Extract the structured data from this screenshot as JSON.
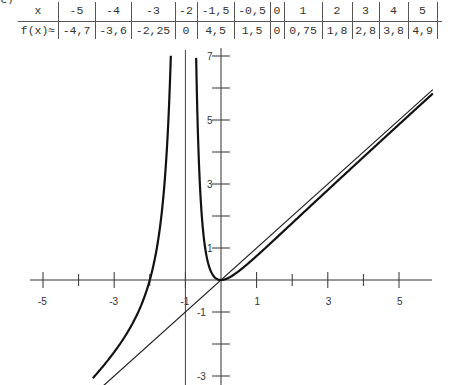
{
  "part_label": "c)",
  "table": {
    "row_headers": [
      "x",
      "f(x)≈"
    ],
    "x_values": [
      "-5",
      "-4",
      "-3",
      "-2",
      "-1,5",
      "-0,5",
      "0",
      "1",
      "2",
      "3",
      "4",
      "5"
    ],
    "f_values": [
      "-4,7",
      "-3,6",
      "-2,25",
      "0",
      "4,5",
      "1,5",
      "0",
      "0,75",
      "1,8",
      "2,8",
      "3,8",
      "4,9"
    ]
  },
  "axes": {
    "x_tick_labels": [
      "-5",
      "-3",
      "-1",
      "1",
      "3",
      "5"
    ],
    "y_tick_labels": [
      "7",
      "5",
      "3",
      "1",
      "-1",
      "-3"
    ]
  },
  "chart_data": {
    "type": "line",
    "title": "",
    "xlabel": "",
    "ylabel": "",
    "xlim": [
      -5.3,
      6
    ],
    "ylim": [
      -3.2,
      7.2
    ],
    "grid": false,
    "x_ticks": [
      -5,
      -4,
      -3,
      -2,
      -1,
      1,
      2,
      3,
      4,
      5
    ],
    "x_tick_labels": [
      "-5",
      "-3",
      "-1",
      "1",
      "3",
      "5"
    ],
    "y_ticks": [
      7,
      6,
      5,
      4,
      3,
      2,
      1,
      -1,
      -2,
      -3
    ],
    "y_tick_labels": [
      "7",
      "5",
      "3",
      "1",
      "-1",
      "-3"
    ],
    "function": "f(x) = x^2 (x+2) / (x+1)^2",
    "vertical_asymptote": {
      "x": -1
    },
    "oblique_asymptote": {
      "equation": "y = x"
    },
    "table_points": {
      "x": [
        -5,
        -4,
        -3,
        -2,
        -1.5,
        -0.5,
        0,
        1,
        2,
        3,
        4,
        5
      ],
      "y": [
        -4.7,
        -3.6,
        -2.25,
        0,
        4.5,
        1.5,
        0,
        0.75,
        1.8,
        2.8,
        3.8,
        4.9
      ]
    },
    "series": [
      {
        "name": "f(x)",
        "style": "thick curve"
      },
      {
        "name": "asymptote y = x",
        "style": "thin line"
      },
      {
        "name": "asymptote x = -1",
        "style": "thin vertical line"
      }
    ]
  }
}
